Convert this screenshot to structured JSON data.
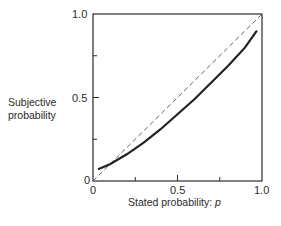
{
  "chart_data": {
    "type": "line",
    "title": "",
    "xlabel": "Stated probability: p",
    "xlabel_text": "Stated probability: ",
    "xlabel_var": "p",
    "ylabel": "Subjective probability",
    "ylabel_line1": "Subjective",
    "ylabel_line2": "probability",
    "xlim": [
      0,
      1
    ],
    "ylim": [
      0,
      1
    ],
    "x_ticks": [
      "0",
      "0.5",
      "1.0"
    ],
    "y_ticks": [
      "0",
      "0.5",
      "1.0"
    ],
    "grid": false,
    "legend": "none",
    "series": [
      {
        "name": "Subjective probability curve",
        "style": "solid",
        "x": [
          0.03,
          0.1,
          0.2,
          0.3,
          0.4,
          0.5,
          0.6,
          0.7,
          0.8,
          0.9,
          0.97
        ],
        "y": [
          0.07,
          0.1,
          0.16,
          0.23,
          0.31,
          0.4,
          0.49,
          0.59,
          0.69,
          0.8,
          0.9
        ]
      },
      {
        "name": "Identity line (y = x)",
        "style": "dashed",
        "x": [
          0,
          1
        ],
        "y": [
          0,
          1
        ]
      }
    ]
  }
}
